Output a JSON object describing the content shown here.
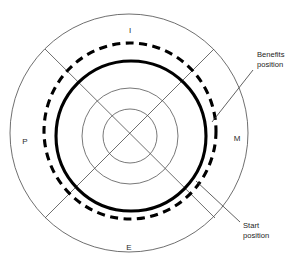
{
  "diagram": {
    "quadrant_labels": [
      {
        "id": "top",
        "text": "I",
        "x": 130,
        "y": 31
      },
      {
        "id": "right",
        "text": "M",
        "x": 237,
        "y": 139
      },
      {
        "id": "bottom",
        "text": "E",
        "x": 129,
        "y": 248
      },
      {
        "id": "left",
        "text": "P",
        "x": 25,
        "y": 142
      }
    ],
    "callouts": [
      {
        "id": "benefits-position",
        "line1": "Benefits",
        "line2": "position",
        "text_x": 257,
        "text_y1": 57,
        "text_y2": 67,
        "leader": {
          "x1": 253,
          "y1": 70,
          "x2": 212,
          "y2": 122
        }
      },
      {
        "id": "start-position",
        "line1": "Start",
        "line2": "position",
        "text_x": 243,
        "text_y1": 228,
        "text_y2": 238,
        "leader": {
          "x1": 240,
          "y1": 222,
          "x2": 196,
          "y2": 181
        }
      }
    ],
    "rings": [
      {
        "id": "outer-boundary-circle",
        "style": "thin",
        "cx": 129,
        "cy": 133,
        "r": 119
      },
      {
        "id": "benefits-ring",
        "style": "thick-dashed",
        "cx": 130,
        "cy": 131,
        "rx": 86,
        "ry": 88
      },
      {
        "id": "start-ring",
        "style": "thick-solid",
        "cx": 131,
        "cy": 136,
        "r": 75
      },
      {
        "id": "inner-ring-mid",
        "style": "thin",
        "cx": 130,
        "cy": 136,
        "r": 48
      },
      {
        "id": "inner-ring-core",
        "style": "thin",
        "cx": 130,
        "cy": 136,
        "r": 27
      }
    ],
    "axes": [
      {
        "id": "diagonal-nw-se",
        "x1": 45,
        "y1": 49,
        "x2": 215,
        "y2": 218
      },
      {
        "id": "diagonal-ne-sw",
        "x1": 214,
        "y1": 49,
        "x2": 45,
        "y2": 218
      }
    ],
    "colors": {
      "background": "#ffffff",
      "thin_stroke": "#4a4a4a",
      "thick_stroke": "#000000",
      "text": "#1c1c1c"
    }
  }
}
